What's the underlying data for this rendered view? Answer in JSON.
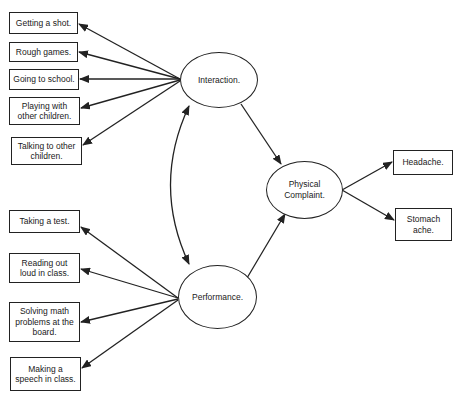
{
  "diagram": {
    "type": "path-model",
    "latent_nodes": [
      {
        "id": "interaction",
        "label": "Interaction."
      },
      {
        "id": "performance",
        "label": "Performance."
      },
      {
        "id": "physical",
        "label": "Physical Complaint."
      }
    ],
    "indicators": {
      "interaction": [
        {
          "label": "Getting a shot."
        },
        {
          "label": "Rough games."
        },
        {
          "label": "Going to school."
        },
        {
          "label": "Playing with other children."
        },
        {
          "label": "Talking to other children."
        }
      ],
      "performance": [
        {
          "label": "Taking a test."
        },
        {
          "label": "Reading out loud in class."
        },
        {
          "label": "Solving math problems at the board."
        },
        {
          "label": "Making a speech in class."
        }
      ],
      "physical": [
        {
          "label": "Headache."
        },
        {
          "label": "Stomach ache."
        }
      ]
    },
    "edges": [
      {
        "from": "Interaction.",
        "to": "Physical Complaint.",
        "type": "directed"
      },
      {
        "from": "Performance.",
        "to": "Physical Complaint.",
        "type": "directed"
      },
      {
        "from": "Interaction.",
        "to": "Performance.",
        "type": "bidirectional-curved"
      },
      {
        "from": "Interaction.",
        "to": "indicators (5)",
        "type": "directed"
      },
      {
        "from": "Performance.",
        "to": "indicators (4)",
        "type": "directed"
      },
      {
        "from": "Physical Complaint.",
        "to": "indicators (2)",
        "type": "directed"
      }
    ],
    "colors": {
      "stroke": "#222222",
      "background": "#ffffff"
    }
  }
}
